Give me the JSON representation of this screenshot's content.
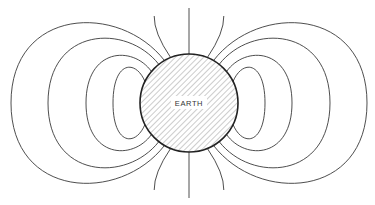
{
  "diagram": {
    "planet_label": "EARTH",
    "colors": {
      "line": "#3a3a3a",
      "outline": "#222222",
      "hatch": "#9a9a9a",
      "background": "#ffffff"
    },
    "field_line_loops_per_side": 4,
    "open_polar_lines_per_pole": 3,
    "sides": [
      "left",
      "right"
    ],
    "poles": [
      "north",
      "south"
    ]
  }
}
